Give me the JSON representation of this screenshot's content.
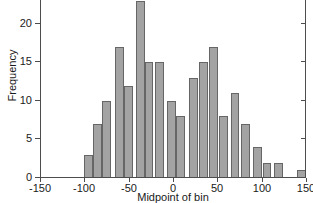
{
  "chart_data": {
    "type": "bar",
    "title": "",
    "xlabel": "Midpoint of bin",
    "ylabel": "Frequency",
    "xlim": [
      -150,
      150
    ],
    "ylim": [
      0,
      24
    ],
    "grid": false,
    "legend": null,
    "bin_width": 10,
    "xticks": [
      -150,
      -100,
      -50,
      0,
      50,
      100,
      150
    ],
    "xtick_labels": [
      "-150",
      "-100",
      "-50",
      "0",
      "50",
      "100",
      "150"
    ],
    "yticks": [
      0,
      5,
      10,
      15,
      20
    ],
    "ytick_labels": [
      "0",
      "5",
      "10",
      "15",
      "20"
    ],
    "categories": [
      -95,
      -85,
      -75,
      -65,
      -55,
      -45,
      -35,
      -25,
      -15,
      -5,
      5,
      15,
      25,
      35,
      45,
      55,
      65,
      75,
      85,
      95,
      105,
      115,
      145
    ],
    "values": [
      3,
      7,
      10,
      17,
      12,
      23,
      15,
      15,
      10,
      8,
      13,
      15,
      17,
      8,
      11,
      7,
      4,
      2,
      2,
      1,
      0,
      0,
      0
    ],
    "bars": [
      {
        "midpoint": -95,
        "frequency": 3
      },
      {
        "midpoint": -85,
        "frequency": 7
      },
      {
        "midpoint": -75,
        "frequency": 10
      },
      {
        "midpoint": -60,
        "frequency": 17
      },
      {
        "midpoint": -50,
        "frequency": 12
      },
      {
        "midpoint": -37,
        "frequency": 23
      },
      {
        "midpoint": -27,
        "frequency": 15
      },
      {
        "midpoint": -15,
        "frequency": 15
      },
      {
        "midpoint": -2,
        "frequency": 10
      },
      {
        "midpoint": 8,
        "frequency": 8
      },
      {
        "midpoint": 23,
        "frequency": 13
      },
      {
        "midpoint": 34,
        "frequency": 15
      },
      {
        "midpoint": 46,
        "frequency": 17
      },
      {
        "midpoint": 57,
        "frequency": 8
      },
      {
        "midpoint": 70,
        "frequency": 11
      },
      {
        "midpoint": 82,
        "frequency": 7
      },
      {
        "midpoint": 95,
        "frequency": 4
      },
      {
        "midpoint": 106,
        "frequency": 2
      },
      {
        "midpoint": 119,
        "frequency": 2
      },
      {
        "midpoint": 145,
        "frequency": 1
      }
    ],
    "colors": {
      "bar_fill": "#a3a3a3",
      "bar_edge": "#666666",
      "axis": "#4d4d4d",
      "text": "#1a1a1a",
      "background": "#ffffff"
    }
  }
}
